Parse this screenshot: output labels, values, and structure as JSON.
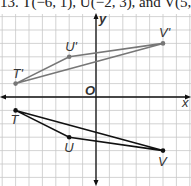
{
  "title": "13. T(−6, 1), U(−2, 3), and V(5, 4)",
  "axes": {
    "x_label": "x",
    "y_label": "y",
    "origin_label": "O"
  },
  "chart_data": {
    "type": "scatter",
    "grid": true,
    "xlim": [
      -7,
      7
    ],
    "ylim": [
      -6,
      6
    ],
    "series": [
      {
        "name": "T'U'V'",
        "color": "#777777",
        "points": [
          {
            "label": "T'",
            "x": -6,
            "y": 1
          },
          {
            "label": "U'",
            "x": -2,
            "y": 3
          },
          {
            "label": "V'",
            "x": 5,
            "y": 4
          }
        ]
      },
      {
        "name": "TUV",
        "color": "#111111",
        "points": [
          {
            "label": "T",
            "x": -6,
            "y": -1
          },
          {
            "label": "U",
            "x": -2,
            "y": -3
          },
          {
            "label": "V",
            "x": 5,
            "y": -4
          }
        ]
      }
    ]
  }
}
